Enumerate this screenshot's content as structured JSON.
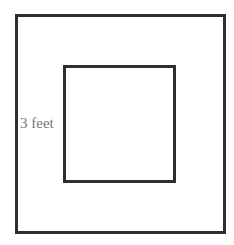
{
  "diagram": {
    "outer_square": {
      "x": 15,
      "y": 14,
      "w": 211,
      "h": 220
    },
    "inner_square": {
      "x": 63,
      "y": 65,
      "w": 113,
      "h": 118
    },
    "label": "3 feet",
    "label_pos": {
      "x": 20,
      "y": 115
    },
    "stroke_color": "#2e2e2e",
    "label_color": "#777777"
  }
}
